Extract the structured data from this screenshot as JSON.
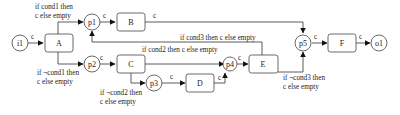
{
  "diagram": {
    "places": [
      {
        "id": "i1",
        "label": "i1"
      },
      {
        "id": "p1",
        "label": "p1"
      },
      {
        "id": "p2",
        "label": "p2"
      },
      {
        "id": "p3",
        "label": "p3"
      },
      {
        "id": "p4",
        "label": "p4"
      },
      {
        "id": "p5",
        "label": "p5"
      },
      {
        "id": "o1",
        "label": "o1"
      }
    ],
    "transitions": [
      {
        "id": "A",
        "label": "A"
      },
      {
        "id": "B",
        "label": "B"
      },
      {
        "id": "C",
        "label": "C"
      },
      {
        "id": "D",
        "label": "D"
      },
      {
        "id": "E",
        "label": "E"
      },
      {
        "id": "F",
        "label": "F"
      }
    ],
    "edge_labels": {
      "c": "c",
      "a_to_p1_line1": "if cond1 then",
      "a_to_p1_line2": "c else empty",
      "a_to_p2_line1": "if ¬cond1 then",
      "a_to_p2_line2": "c else empty",
      "c_to_p3_line1": "if ¬cond2 then",
      "c_to_p3_line2": "c else empty",
      "c_to_p4": "if cond2 then c else empty",
      "e_to_p1": "if cond3 then c else empty",
      "e_to_p5_line1": "if ¬cond3 then",
      "e_to_p5_line2": "c else empty"
    }
  }
}
